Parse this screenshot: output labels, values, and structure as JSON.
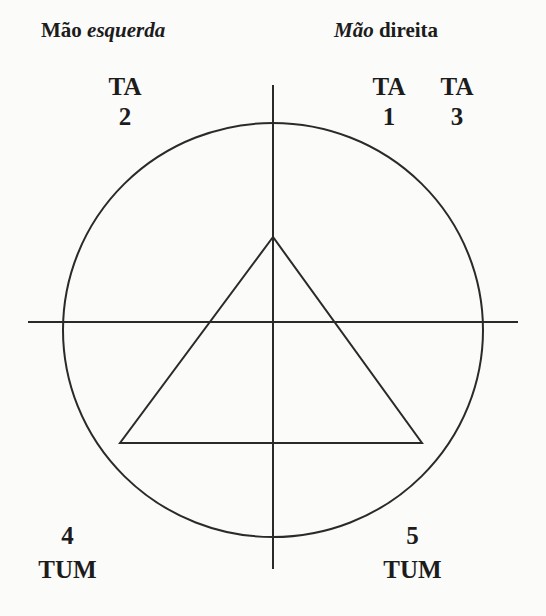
{
  "headers": {
    "left": {
      "normal": "Mão",
      "italic": "esquerda"
    },
    "right": {
      "italic": "Mão",
      "normal": "direita"
    }
  },
  "beats": [
    {
      "id": "ta-2",
      "syllable": "TA",
      "number": "2",
      "position": "top-left"
    },
    {
      "id": "ta-1",
      "syllable": "TA",
      "number": "1",
      "position": "top-right-inner"
    },
    {
      "id": "ta-3",
      "syllable": "TA",
      "number": "3",
      "position": "top-right-outer"
    },
    {
      "id": "tum-4",
      "syllable": "TUM",
      "number": "4",
      "position": "bottom-left"
    },
    {
      "id": "tum-5",
      "syllable": "TUM",
      "number": "5",
      "position": "bottom-right"
    }
  ],
  "shapes": {
    "circle": {
      "cx": 273,
      "cy": 330,
      "rx": 210,
      "ry": 207
    },
    "horizontal_axis": {
      "x1": 28,
      "y1": 322,
      "x2": 518,
      "y2": 322
    },
    "vertical_axis": {
      "x1": 273,
      "y1": 85,
      "x2": 273,
      "y2": 569
    },
    "triangle": {
      "points": "273,237 120,443 422,443"
    },
    "stroke_color": "#2a2a2a"
  }
}
